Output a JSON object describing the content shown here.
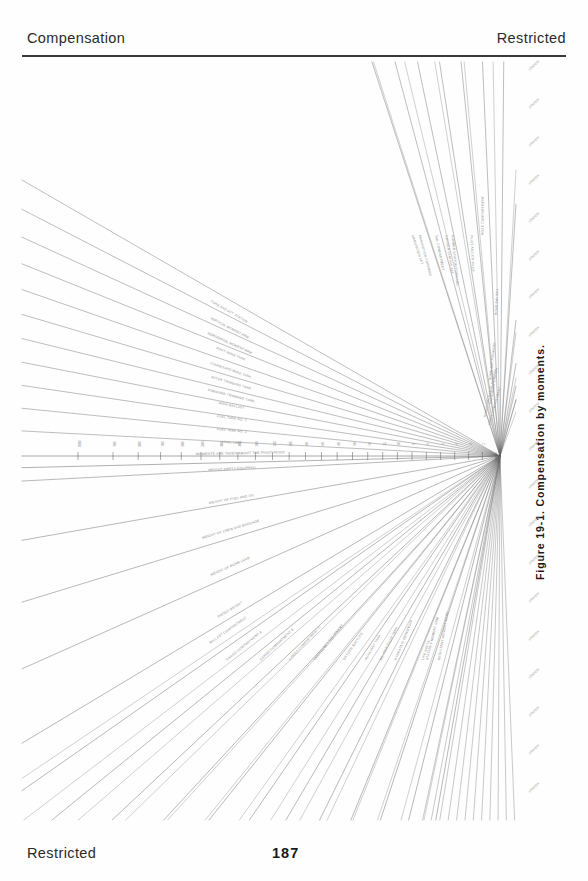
{
  "header": {
    "left_title": "Compensation",
    "right_classification": "Restricted"
  },
  "footer": {
    "left_classification": "Restricted",
    "page_number": "187"
  },
  "figure": {
    "caption": "Figure 19-1.   Compensation by moments.",
    "type": "nomogram-fan-diagram",
    "convergence_point": {
      "x": 500,
      "y": 456
    },
    "axis_note": "MOMENTS  ARE  TAKEN  ABOUT  THE  PIVOT  POINT"
  },
  "chart_data": {
    "type": "line",
    "title": "Compensation by moments",
    "xlabel": "",
    "ylabel": "",
    "grid": false,
    "legend": "none",
    "convergence": {
      "x": 500,
      "y": 456
    },
    "axis_ticks": [
      "1000",
      "900",
      "800",
      "700",
      "600",
      "500",
      "400",
      "300",
      "200",
      "150",
      "100",
      "80",
      "60",
      "40",
      "30",
      "20",
      "15",
      "10",
      "8",
      "6",
      "5",
      "4",
      "3",
      "2",
      "1"
    ],
    "rays_upper_left": [
      "FORE AND AFT STATION",
      "VERTICAL MOMENT ARM",
      "HORIZONTAL MOMENT ARM",
      "PORT WING TANK",
      "STARBOARD WING TANK",
      "AFTER TRIMMING TANK",
      "FORWARD TRIMMING TANK",
      "MAIN BALLAST",
      "FUEL TANK NO. 1",
      "FUEL TANK NO. 2",
      "LOAD LIMIT"
    ],
    "rays_upper_right": [
      "CREW COMPARTMENT",
      "RADIO OPERATOR STATION",
      "NAVIGATOR STATION",
      "BOMB BAY FORWARD",
      "BOMB BAY AFT",
      "NOSE COMPARTMENT",
      "PILOT AND CO-PILOT",
      "GUNNER STATION FORWARD",
      "GUNNER STATION AFT",
      "TAIL COMPARTMENT",
      "AMMUNITION FORWARD",
      "AMMUNITION AFT"
    ],
    "rays_lower_left": [
      "WEIGHT EMPTY EQUIPPED",
      "WEIGHT OF FUEL AND OIL",
      "WEIGHT OF CREW AND BAGGAGE",
      "WEIGHT OF BOMB LOAD",
      "GROSS WEIGHT"
    ],
    "rays_lower_right": [
      "BALLAST COMPARTMENT",
      "CARGO COMPARTMENT A",
      "CARGO COMPARTMENT B",
      "CARGO COMPARTMENT C",
      "EMERGENCY EQUIPMENT",
      "OXYGEN BOTTLES",
      "AUXILIARY TANK",
      "DE-ICER FLUID TANK",
      "HYDRAULIC RESERVOIR",
      "LIFE RAFTS",
      "STATION 6 MOMENT ARM",
      "RESULTANT MOMENT TOTAL"
    ],
    "margin_stubs_right": [
      "STATION",
      "STATION",
      "STATION",
      "STATION",
      "STATION",
      "STATION",
      "STATION",
      "STATION",
      "STATION",
      "STATION",
      "STATION",
      "STATION",
      "STATION",
      "STATION",
      "STATION",
      "STATION",
      "STATION",
      "STATION",
      "STATION",
      "STATION"
    ]
  }
}
